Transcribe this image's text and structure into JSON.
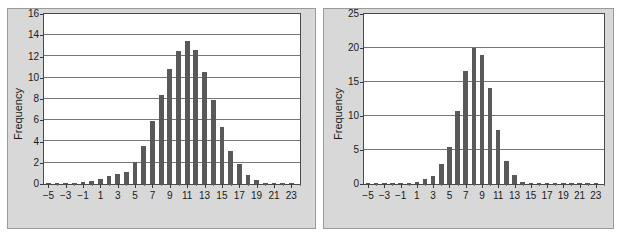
{
  "figure": {
    "background_color": "#ffffff",
    "panel_color": "#d8d8d8",
    "bar_color": "#595959",
    "axis_color": "#4a4a4a",
    "grid_color": "#777777"
  },
  "chart_data": [
    {
      "type": "bar",
      "id": "left",
      "title": "25 Years in Stocks",
      "xlabel": "",
      "ylabel": "Frequency",
      "xlim": [
        -5.5,
        24.0
      ],
      "ylim": [
        0,
        16
      ],
      "yticks": [
        0,
        2,
        4,
        6,
        8,
        10,
        12,
        14,
        16
      ],
      "ytick_labels": [
        "0",
        "2",
        "4",
        "6",
        "8",
        "10",
        "12",
        "14",
        "16"
      ],
      "xticks": [
        -5,
        -3,
        -1,
        1,
        3,
        5,
        7,
        9,
        11,
        13,
        15,
        17,
        19,
        21,
        23
      ],
      "xtick_labels": [
        "-5",
        "-3",
        "-1",
        "1",
        "3",
        "5",
        "7",
        "9",
        "11",
        "13",
        "15",
        "17",
        "19",
        "21",
        "23"
      ],
      "grid": true,
      "legend": "none",
      "x": [
        -5,
        -4,
        -3,
        -2,
        -1,
        0,
        1,
        2,
        3,
        4,
        5,
        6,
        7,
        8,
        9,
        10,
        11,
        12,
        13,
        14,
        15,
        16,
        17,
        18,
        19,
        20,
        21,
        22,
        23
      ],
      "values": [
        0.05,
        0.05,
        0.05,
        0.1,
        0.2,
        0.25,
        0.5,
        0.75,
        0.9,
        1.15,
        2.1,
        3.55,
        5.9,
        8.4,
        10.85,
        12.55,
        13.5,
        12.6,
        10.5,
        7.9,
        5.35,
        3.15,
        1.9,
        0.85,
        0.4,
        0.1,
        0.05,
        0.02,
        0.02
      ]
    },
    {
      "type": "bar",
      "id": "right",
      "title": "10 Years in Stocks and 15 Years in T-Bills",
      "xlabel": "",
      "ylabel": "Frequency",
      "xlim": [
        -5.5,
        24.0
      ],
      "ylim": [
        0,
        25
      ],
      "yticks": [
        0,
        5,
        10,
        15,
        20,
        25
      ],
      "ytick_labels": [
        "0",
        "5",
        "10",
        "15",
        "20",
        "25"
      ],
      "xticks": [
        -5,
        -3,
        -1,
        1,
        3,
        5,
        7,
        9,
        11,
        13,
        15,
        17,
        19,
        21,
        23
      ],
      "xtick_labels": [
        "-5",
        "-3",
        "-1",
        "1",
        "3",
        "5",
        "7",
        "9",
        "11",
        "13",
        "15",
        "17",
        "19",
        "21",
        "23"
      ],
      "grid": true,
      "legend": "none",
      "x": [
        -5,
        -4,
        -3,
        -2,
        -1,
        0,
        1,
        2,
        3,
        4,
        5,
        6,
        7,
        8,
        9,
        10,
        11,
        12,
        13,
        14,
        15,
        16,
        17,
        18,
        19,
        20,
        21,
        22,
        23
      ],
      "values": [
        0.05,
        0.05,
        0.05,
        0.05,
        0.05,
        0.1,
        0.25,
        0.75,
        1.2,
        3.0,
        5.5,
        10.8,
        16.6,
        20.0,
        19.0,
        14.1,
        7.9,
        3.4,
        1.3,
        0.25,
        0.1,
        0.05,
        0.05,
        0.02,
        0.02,
        0.02,
        0.02,
        0.02,
        0.02
      ]
    }
  ]
}
